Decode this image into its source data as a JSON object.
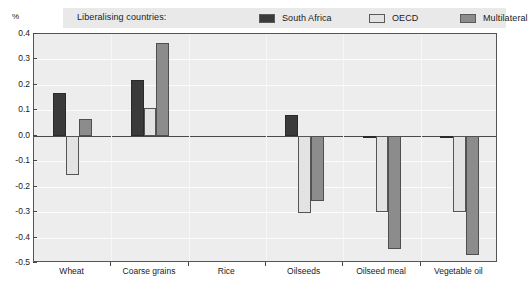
{
  "unit_label": "%",
  "legend": {
    "caption": "Liberalising countries:",
    "entries": [
      {
        "label": "South Africa",
        "color": "#3a3a3a"
      },
      {
        "label": "OECD",
        "color": "#e3e3e3"
      },
      {
        "label": "Multilateral",
        "color": "#8c8c8c"
      }
    ]
  },
  "chart_data": {
    "type": "bar",
    "title": "",
    "subtitle": "",
    "xlabel": "",
    "ylabel": "%",
    "ylim": [
      -0.5,
      0.4
    ],
    "ytick_step": 0.1,
    "yticks": [
      "0.4",
      "0.3",
      "0.2",
      "0.1",
      "0.0",
      "-0.1",
      "-0.2",
      "-0.3",
      "-0.4",
      "-0.5"
    ],
    "ytick_values": [
      0.4,
      0.3,
      0.2,
      0.1,
      0.0,
      -0.1,
      -0.2,
      -0.3,
      -0.4,
      -0.5
    ],
    "grid": true,
    "legend_position": "top",
    "categories": [
      "Wheat",
      "Coarse grains",
      "Rice",
      "Oilseeds",
      "Oilseed meal",
      "Vegetable oil"
    ],
    "series": [
      {
        "name": "South Africa",
        "color": "#3a3a3a",
        "values": [
          0.17,
          0.22,
          0.0,
          0.08,
          -0.01,
          -0.01
        ]
      },
      {
        "name": "OECD",
        "color": "#e3e3e3",
        "values": [
          -0.155,
          0.11,
          0.0,
          -0.305,
          -0.3,
          -0.3
        ]
      },
      {
        "name": "Multilateral",
        "color": "#8c8c8c",
        "values": [
          0.065,
          0.365,
          0.0,
          -0.255,
          -0.445,
          -0.47
        ]
      }
    ]
  }
}
